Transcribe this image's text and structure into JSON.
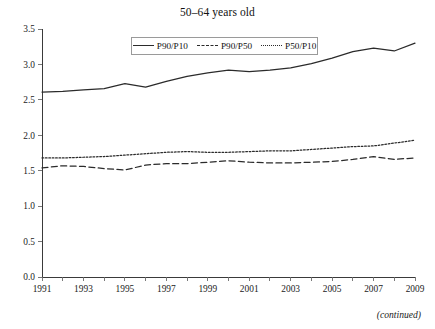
{
  "figure": {
    "title": "50–64 years old",
    "note": "(continued)"
  },
  "legend": {
    "items": [
      {
        "label": "P90/P10",
        "style": "solid"
      },
      {
        "label": "P90/P50",
        "style": "dashed"
      },
      {
        "label": "P50/P10",
        "style": "dotted"
      }
    ]
  },
  "axes": {
    "y_ticks": [
      "0.0",
      "0.5",
      "1.0",
      "1.5",
      "2.0",
      "2.5",
      "3.0",
      "3.5"
    ],
    "x_ticks": [
      "1991",
      "1993",
      "1995",
      "1997",
      "1999",
      "2001",
      "2003",
      "2005",
      "2007",
      "2009"
    ]
  },
  "chart_data": {
    "type": "line",
    "title": "50–64 years old",
    "xlabel": "",
    "ylabel": "",
    "xlim": [
      1991,
      2009
    ],
    "ylim": [
      0.0,
      3.5
    ],
    "ytick_step": 0.5,
    "grid": false,
    "legend_position": "top-center",
    "x": [
      1991,
      1992,
      1993,
      1994,
      1995,
      1996,
      1997,
      1998,
      1999,
      2000,
      2001,
      2002,
      2003,
      2004,
      2005,
      2006,
      2007,
      2008,
      2009
    ],
    "series": [
      {
        "name": "P90/P10",
        "style": "solid",
        "values": [
          2.61,
          2.62,
          2.64,
          2.66,
          2.73,
          2.68,
          2.76,
          2.83,
          2.88,
          2.92,
          2.9,
          2.92,
          2.95,
          3.01,
          3.09,
          3.18,
          3.23,
          3.19,
          3.3
        ]
      },
      {
        "name": "P90/P50",
        "style": "dashed",
        "values": [
          1.54,
          1.57,
          1.56,
          1.53,
          1.51,
          1.58,
          1.6,
          1.6,
          1.62,
          1.64,
          1.62,
          1.61,
          1.61,
          1.62,
          1.63,
          1.66,
          1.7,
          1.66,
          1.68
        ]
      },
      {
        "name": "P50/P10",
        "style": "dotted",
        "values": [
          1.68,
          1.68,
          1.69,
          1.7,
          1.72,
          1.74,
          1.76,
          1.77,
          1.76,
          1.76,
          1.77,
          1.78,
          1.78,
          1.8,
          1.82,
          1.84,
          1.85,
          1.89,
          1.93
        ]
      }
    ]
  }
}
